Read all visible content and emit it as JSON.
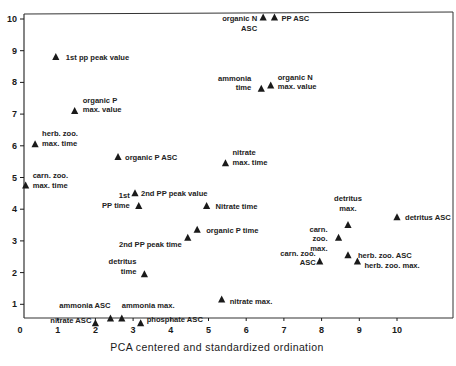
{
  "chart_data": {
    "type": "scatter",
    "title": "",
    "xlabel": "PCA centered and standardized ordination",
    "ylabel": "",
    "xlim": [
      0,
      11.2
    ],
    "ylim": [
      0.2,
      10.4
    ],
    "x_ticks": [
      0,
      1,
      2,
      3,
      4,
      5,
      6,
      7,
      8,
      9,
      10
    ],
    "y_ticks": [
      1,
      2,
      3,
      4,
      5,
      6,
      7,
      8,
      9,
      10
    ],
    "grid": false,
    "legend": null,
    "marker": "triangle",
    "points": [
      {
        "label": [
          "organic N",
          "ASC"
        ],
        "x": 6.45,
        "y": 10.05,
        "lx": -6,
        "ly": 4,
        "anchor": "end"
      },
      {
        "label": [
          "PP ASC"
        ],
        "x": 6.75,
        "y": 10.05,
        "lx": 7,
        "ly": 4,
        "anchor": "start"
      },
      {
        "label": [
          "1st pp peak value"
        ],
        "x": 0.95,
        "y": 8.8,
        "lx": 10,
        "ly": 3,
        "anchor": "start"
      },
      {
        "label": [
          "ammonia",
          "time"
        ],
        "x": 6.4,
        "y": 7.8,
        "lx": -10,
        "ly": -8,
        "anchor": "end"
      },
      {
        "label": [
          "organic N",
          "max. value"
        ],
        "x": 6.65,
        "y": 7.9,
        "lx": 7,
        "ly": -6,
        "anchor": "start"
      },
      {
        "label": [
          "organic P",
          "max. value"
        ],
        "x": 1.45,
        "y": 7.1,
        "lx": 8,
        "ly": -8,
        "anchor": "start"
      },
      {
        "label": [
          "herb. zoo.",
          "max. time"
        ],
        "x": 0.4,
        "y": 6.05,
        "lx": 7,
        "ly": -8,
        "anchor": "start"
      },
      {
        "label": [
          "organic P ASC"
        ],
        "x": 2.6,
        "y": 5.65,
        "lx": 7,
        "ly": 3,
        "anchor": "start"
      },
      {
        "label": [
          "nitrate",
          "max. time"
        ],
        "x": 5.45,
        "y": 5.45,
        "lx": 7,
        "ly": -8,
        "anchor": "start"
      },
      {
        "label": [
          "carn. zoo.",
          "max. time"
        ],
        "x": 0.15,
        "y": 4.75,
        "lx": 7,
        "ly": -7,
        "anchor": "start"
      },
      {
        "label": [
          "2nd PP peak value"
        ],
        "x": 3.05,
        "y": 4.5,
        "lx": 6,
        "ly": 3,
        "anchor": "start"
      },
      {
        "label": [
          "1st",
          "PP time"
        ],
        "x": 3.15,
        "y": 4.1,
        "lx": -9,
        "ly": -8,
        "anchor": "end"
      },
      {
        "label": [
          "Nitrate time"
        ],
        "x": 4.95,
        "y": 4.1,
        "lx": 9,
        "ly": 3,
        "anchor": "start"
      },
      {
        "label": [
          "detritus",
          "max."
        ],
        "x": 8.7,
        "y": 3.5,
        "lx": 0,
        "ly": -24,
        "anchor": "middle"
      },
      {
        "label": [
          "detritus ASC"
        ],
        "x": 10.0,
        "y": 3.75,
        "lx": 8,
        "ly": 3,
        "anchor": "start"
      },
      {
        "label": [
          "organic P time"
        ],
        "x": 4.7,
        "y": 3.35,
        "lx": 9,
        "ly": 3,
        "anchor": "start"
      },
      {
        "label": [
          "carn.",
          "zoo.",
          "max."
        ],
        "x": 8.45,
        "y": 3.1,
        "lx": -11,
        "ly": -6,
        "anchor": "end"
      },
      {
        "label": [
          "2nd PP peak time"
        ],
        "x": 4.45,
        "y": 3.1,
        "lx": -6,
        "ly": 9,
        "anchor": "end"
      },
      {
        "label": [
          "herb. zoo. ASC"
        ],
        "x": 8.7,
        "y": 2.55,
        "lx": 10,
        "ly": 3,
        "anchor": "start"
      },
      {
        "label": [
          "carn. zoo.",
          "ASC"
        ],
        "x": 7.95,
        "y": 2.35,
        "lx": -4,
        "ly": -6,
        "anchor": "end"
      },
      {
        "label": [
          "herb. zoo. max."
        ],
        "x": 8.95,
        "y": 2.35,
        "lx": 7,
        "ly": 6,
        "anchor": "start"
      },
      {
        "label": [
          "detritus",
          "time"
        ],
        "x": 3.3,
        "y": 1.95,
        "lx": -8,
        "ly": -10,
        "anchor": "end"
      },
      {
        "label": [
          "nitrate max."
        ],
        "x": 5.35,
        "y": 1.15,
        "lx": 8,
        "ly": 4,
        "anchor": "start"
      },
      {
        "label": [
          "ammonia ASC"
        ],
        "x": 2.4,
        "y": 0.55,
        "lx": 0,
        "ly": -11,
        "anchor": "end"
      },
      {
        "label": [
          "ammonia max."
        ],
        "x": 2.7,
        "y": 0.55,
        "lx": 0,
        "ly": -11,
        "anchor": "start"
      },
      {
        "label": [
          "nitrate ASC"
        ],
        "x": 2.0,
        "y": 0.4,
        "lx": -4,
        "ly": 0,
        "anchor": "end"
      },
      {
        "label": [
          "phosphate ASC"
        ],
        "x": 3.2,
        "y": 0.4,
        "lx": 6,
        "ly": -1,
        "anchor": "start"
      }
    ]
  },
  "colors": {
    "ink": "#1a1a1a",
    "background": "#ffffff",
    "frame": "#333333"
  }
}
